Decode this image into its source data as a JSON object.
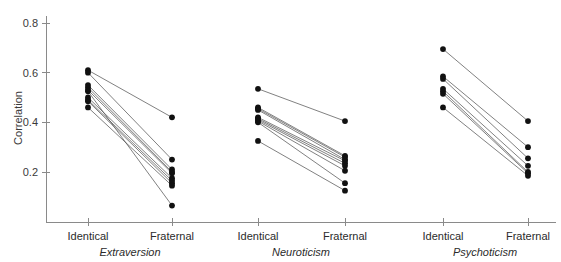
{
  "chart_data": {
    "type": "line",
    "title": "",
    "subtitle": "",
    "xlabel": "",
    "ylabel": "Correlation",
    "ylim": [
      0.0,
      0.85
    ],
    "yticks": [
      0.2,
      0.4,
      0.6,
      0.8
    ],
    "ytick_labels": [
      "0.2",
      "0.4",
      "0.6",
      "0.8"
    ],
    "grid": false,
    "legend": "none",
    "categories": [
      "Identical",
      "Fraternal"
    ],
    "panels": [
      {
        "name": "Extraversion",
        "label": "Extraversion",
        "categories": [
          "Identical",
          "Fraternal"
        ],
        "series": [
          {
            "name": "study-1",
            "values": [
              0.61,
              0.42
            ]
          },
          {
            "name": "study-2",
            "values": [
              0.6,
              0.25
            ]
          },
          {
            "name": "study-3",
            "values": [
              0.55,
              0.21
            ]
          },
          {
            "name": "study-4",
            "values": [
              0.54,
              0.2
            ]
          },
          {
            "name": "study-5",
            "values": [
              0.53,
              0.195
            ]
          },
          {
            "name": "study-6",
            "values": [
              0.5,
              0.175
            ]
          },
          {
            "name": "study-7",
            "values": [
              0.49,
              0.165
            ]
          },
          {
            "name": "study-8",
            "values": [
              0.485,
              0.155
            ]
          },
          {
            "name": "study-9",
            "values": [
              0.46,
              0.145
            ]
          },
          {
            "name": "study-10",
            "values": [
              0.525,
              0.065
            ]
          }
        ]
      },
      {
        "name": "Neuroticism",
        "label": "Neuroticism",
        "categories": [
          "Identical",
          "Fraternal"
        ],
        "series": [
          {
            "name": "study-1",
            "values": [
              0.535,
              0.405
            ]
          },
          {
            "name": "study-2",
            "values": [
              0.46,
              0.265
            ]
          },
          {
            "name": "study-3",
            "values": [
              0.455,
              0.26
            ]
          },
          {
            "name": "study-4",
            "values": [
              0.45,
              0.25
            ]
          },
          {
            "name": "study-5",
            "values": [
              0.42,
              0.245
            ]
          },
          {
            "name": "study-6",
            "values": [
              0.415,
              0.235
            ]
          },
          {
            "name": "study-7",
            "values": [
              0.41,
              0.225
            ]
          },
          {
            "name": "study-8",
            "values": [
              0.405,
              0.205
            ]
          },
          {
            "name": "study-9",
            "values": [
              0.4,
              0.155
            ]
          },
          {
            "name": "study-10",
            "values": [
              0.325,
              0.125
            ]
          }
        ]
      },
      {
        "name": "Psychoticism",
        "label": "Psychoticism",
        "categories": [
          "Identical",
          "Fraternal"
        ],
        "series": [
          {
            "name": "study-1",
            "values": [
              0.695,
              0.405
            ]
          },
          {
            "name": "study-2",
            "values": [
              0.585,
              0.3
            ]
          },
          {
            "name": "study-3",
            "values": [
              0.575,
              0.255
            ]
          },
          {
            "name": "study-4",
            "values": [
              0.535,
              0.225
            ]
          },
          {
            "name": "study-5",
            "values": [
              0.525,
              0.2
            ]
          },
          {
            "name": "study-6",
            "values": [
              0.515,
              0.195
            ]
          },
          {
            "name": "study-7",
            "values": [
              0.46,
              0.185
            ]
          }
        ]
      }
    ]
  },
  "axis": {
    "y_title": "Correlation"
  }
}
